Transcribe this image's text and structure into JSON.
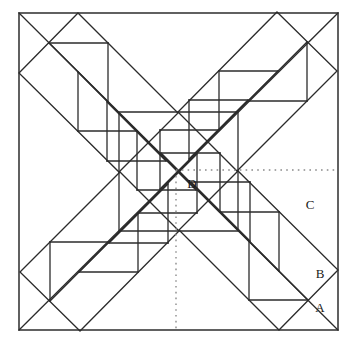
{
  "figure": {
    "type": "geometric-diagram",
    "canvas": {
      "width": 349,
      "height": 341
    },
    "colors": {
      "background": "#ffffff",
      "stroke": "#2b2b2b",
      "outer_border": "#3a3a3a",
      "dotted": "#8a8a8a",
      "label": "#1a1a1a"
    },
    "stroke_widths": {
      "outer_border": 1.6,
      "main": 1.3,
      "dotted": 1.4
    },
    "outer_square": {
      "name": "outer-square",
      "x": 19,
      "y": 13,
      "width": 319,
      "height": 317
    },
    "center_point": {
      "x": 178.5,
      "y": 171.5
    },
    "symmetry": "4-fold rotational (90 degrees) about the center",
    "labels": [
      {
        "id": "A",
        "text": "A",
        "x": 320,
        "y": 309
      },
      {
        "id": "B",
        "text": "B",
        "x": 320,
        "y": 275
      },
      {
        "id": "C",
        "text": "C",
        "x": 310,
        "y": 206
      },
      {
        "id": "D",
        "text": "D",
        "x": 192,
        "y": 185
      }
    ],
    "dotted_lines": [
      {
        "name": "dotted-horizontal",
        "x1": 176,
        "y1": 170,
        "x2": 338,
        "y2": 170,
        "orientation": "horizontal"
      },
      {
        "name": "dotted-vertical",
        "x1": 176,
        "y1": 170,
        "x2": 176,
        "y2": 330,
        "orientation": "vertical"
      }
    ],
    "main_diagonals": [
      {
        "name": "diagonal-tl-br",
        "x1": 19,
        "y1": 13,
        "x2": 338,
        "y2": 330
      },
      {
        "name": "diagonal-tr-bl",
        "x1": 338,
        "y1": 13,
        "x2": 19,
        "y2": 330
      }
    ],
    "central_square": {
      "name": "central-rotated-square",
      "points": "119,112 238,112 238,231 119,231",
      "note": "axis-aligned square centered on the figure center"
    },
    "arms": [
      {
        "id": "arm-top-left",
        "rotation_deg": 0
      },
      {
        "id": "arm-top-right",
        "rotation_deg": 90
      },
      {
        "id": "arm-bottom-right",
        "rotation_deg": 180
      },
      {
        "id": "arm-bottom-left",
        "rotation_deg": 270
      }
    ],
    "arm_geometry": {
      "note": "Each arm is a square rotated 45 degrees, subdivided into a descending chain of half-square right triangles.",
      "outer_diamond": "19,73 78,13 178,113 119,172",
      "chain_lines": [
        "49,43 108,43",
        "108,43 108,102",
        "49,43 108,102",
        "78,72 78,131",
        "78,131 137,131",
        "78,72 137,131",
        "107,102 107,161",
        "107,161 166,161",
        "107,102 166,161",
        "137,131 137,190",
        "137,190 196,190",
        "137,131 196,190"
      ]
    }
  }
}
